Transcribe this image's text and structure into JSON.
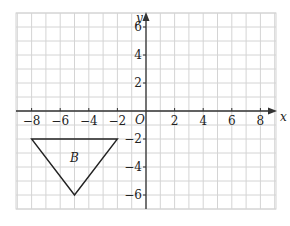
{
  "diagram": {
    "type": "coordinate-grid",
    "x_axis": {
      "label": "x",
      "min": -9,
      "max": 9,
      "ticks": [
        -8,
        -6,
        -4,
        -2,
        2,
        4,
        6,
        8
      ],
      "tick_labels": [
        "−8",
        "−6",
        "−4",
        "−2",
        "2",
        "4",
        "6",
        "8"
      ]
    },
    "y_axis": {
      "label": "y",
      "min": -7,
      "max": 7,
      "ticks": [
        6,
        4,
        2,
        -2,
        -4,
        -6
      ],
      "tick_labels": [
        "6",
        "4",
        "2",
        "−2",
        "−4",
        "−6"
      ]
    },
    "origin_label": "O",
    "shape": {
      "name": "B",
      "type": "triangle",
      "vertices": [
        [
          -8,
          -2
        ],
        [
          -2,
          -2
        ],
        [
          -5,
          -6
        ]
      ]
    },
    "colors": {
      "grid": "#d4d4d4",
      "axis": "#333333",
      "shape": "#222222"
    }
  }
}
